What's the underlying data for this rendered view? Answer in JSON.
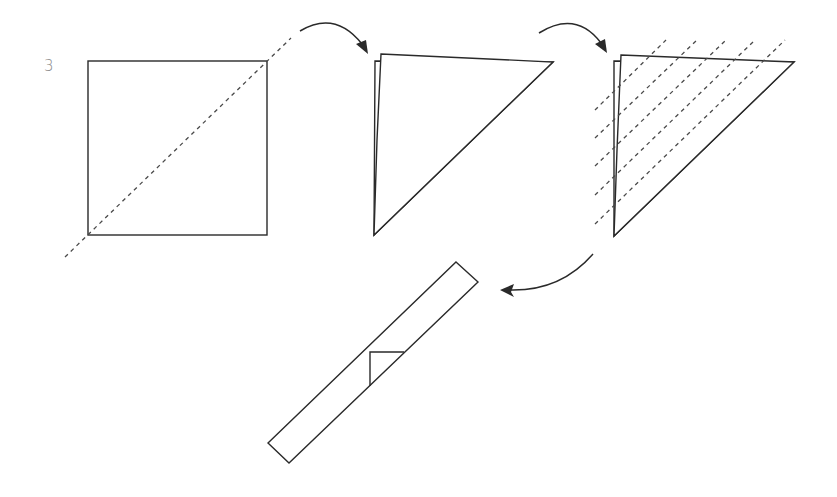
{
  "step": {
    "number": "3"
  },
  "diagram": {
    "stages": [
      {
        "id": "square",
        "description": "Square sheet with diagonal valley fold (dashed)"
      },
      {
        "id": "triangle",
        "description": "Sheet folded in half along the diagonal into a triangle"
      },
      {
        "id": "triangle-pleats",
        "description": "Triangle with five parallel dashed fold lines"
      },
      {
        "id": "strip",
        "description": "Resulting narrow folded strip with small triangular flap"
      }
    ],
    "arrows": [
      {
        "from": "square",
        "to": "triangle"
      },
      {
        "from": "triangle",
        "to": "triangle-pleats"
      },
      {
        "from": "triangle-pleats",
        "to": "strip"
      }
    ],
    "fold_line_count": 5,
    "colors": {
      "line": "#2a2a2a",
      "dashed": "#4a4a4a",
      "step_number": "#8a8a8a",
      "background": "#ffffff"
    }
  }
}
